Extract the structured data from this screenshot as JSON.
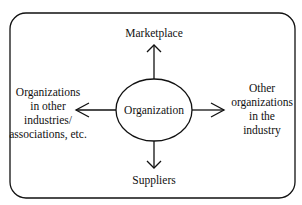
{
  "diagram": {
    "center": "Organization",
    "top": "Marketplace",
    "bottom": "Suppliers",
    "left": [
      "Organizations",
      "in other",
      "industries/",
      "associations, etc."
    ],
    "right": [
      "Other",
      "organizations",
      "in the",
      "industry"
    ]
  },
  "colors": {
    "stroke": "#111111",
    "background": "#ffffff"
  }
}
